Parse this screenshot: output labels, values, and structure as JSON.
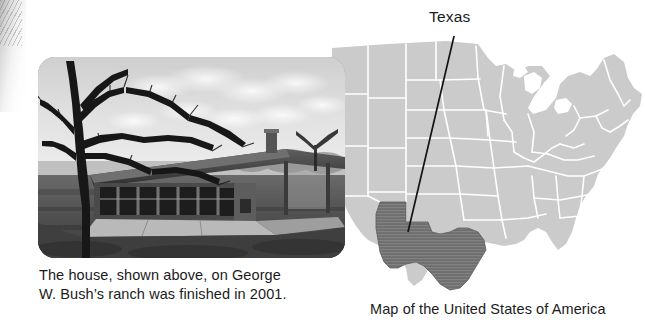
{
  "photo": {
    "alt_name": "black-and-white photograph of a low ranch house with a large tree",
    "caption_line1": "The house, shown above, on George",
    "caption_line2": "W. Bush’s ranch was finished in 2001."
  },
  "map": {
    "callout_label": "Texas",
    "caption": "Map of the United States of America",
    "highlighted_state": "Texas",
    "colors": {
      "state_fill": "#cbcbcb",
      "state_border": "#ffffff",
      "highlight_fill": "#6e6e6e",
      "highlight_stripe": "#838383",
      "leader_line": "#141414",
      "background": "#ffffff",
      "text": "#1b1b1b"
    }
  }
}
